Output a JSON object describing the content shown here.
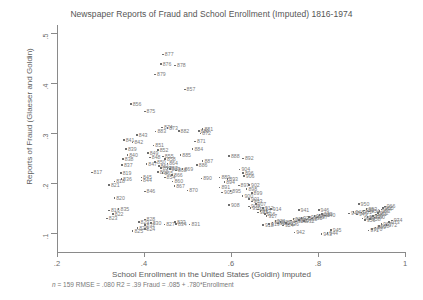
{
  "chart_data": {
    "type": "scatter",
    "title": "Newspaper Reports of Fraud and School Enrollment (Imputed) 1816-1974",
    "xlabel": "School Enrollment in the United States (Goldin) Imputed",
    "ylabel": "Reports of Fraud (Glaeser and Goldin)",
    "xlim": [
      0.16,
      1.03
    ],
    "ylim": [
      0.07,
      0.52
    ],
    "xticks": [
      ".2",
      ".4",
      ".6",
      ".8",
      "1"
    ],
    "xtickvals": [
      0.2,
      0.4,
      0.6,
      0.8,
      1.0
    ],
    "yticks": [
      ".1",
      ".2",
      ".3",
      ".4",
      ".5"
    ],
    "ytickvals": [
      0.1,
      0.2,
      0.3,
      0.4,
      0.5
    ],
    "grid": false,
    "legend": null,
    "point_labels": "year (last three digits)",
    "marker": "small square",
    "marker_color": "#6e6e6e",
    "label_color": "#7c7c7c",
    "annotation": "n = 159   RMSE =  .080 R2 =  .39  Fraud =  .085 +  .780*Enrollment",
    "annotation_parts": {
      "n": "159",
      "rmse": ".080",
      "r2": ".39",
      "intercept": ".085",
      "slope": ".780",
      "equation": "Fraud =  .085 +  .780*Enrollment"
    },
    "points": [
      {
        "label": "816",
        "x": 0.318,
        "y": 0.147
      },
      {
        "label": "817",
        "x": 0.278,
        "y": 0.223
      },
      {
        "label": "818",
        "x": 0.33,
        "y": 0.205
      },
      {
        "label": "819",
        "x": 0.345,
        "y": 0.222
      },
      {
        "label": "820",
        "x": 0.33,
        "y": 0.172
      },
      {
        "label": "821",
        "x": 0.318,
        "y": 0.198
      },
      {
        "label": "822",
        "x": 0.327,
        "y": 0.14
      },
      {
        "label": "823",
        "x": 0.313,
        "y": 0.131
      },
      {
        "label": "824",
        "x": 0.4,
        "y": 0.11
      },
      {
        "label": "825",
        "x": 0.372,
        "y": 0.106
      },
      {
        "label": "826",
        "x": 0.383,
        "y": 0.112
      },
      {
        "label": "827",
        "x": 0.445,
        "y": 0.119
      },
      {
        "label": "828",
        "x": 0.4,
        "y": 0.129
      },
      {
        "label": "829",
        "x": 0.386,
        "y": 0.124
      },
      {
        "label": "830",
        "x": 0.414,
        "y": 0.122
      },
      {
        "label": "831",
        "x": 0.503,
        "y": 0.119
      },
      {
        "label": "832",
        "x": 0.4,
        "y": 0.118
      },
      {
        "label": "833",
        "x": 0.47,
        "y": 0.124
      },
      {
        "label": "834",
        "x": 0.472,
        "y": 0.12
      },
      {
        "label": "835",
        "x": 0.34,
        "y": 0.15
      },
      {
        "label": "836",
        "x": 0.346,
        "y": 0.21
      },
      {
        "label": "837",
        "x": 0.348,
        "y": 0.238
      },
      {
        "label": "838",
        "x": 0.35,
        "y": 0.25
      },
      {
        "label": "839",
        "x": 0.357,
        "y": 0.27
      },
      {
        "label": "840",
        "x": 0.36,
        "y": 0.258
      },
      {
        "label": "841",
        "x": 0.352,
        "y": 0.288
      },
      {
        "label": "842",
        "x": 0.372,
        "y": 0.283
      },
      {
        "label": "843",
        "x": 0.382,
        "y": 0.298
      },
      {
        "label": "844",
        "x": 0.392,
        "y": 0.207
      },
      {
        "label": "845",
        "x": 0.392,
        "y": 0.213
      },
      {
        "label": "846",
        "x": 0.4,
        "y": 0.185
      },
      {
        "label": "847",
        "x": 0.404,
        "y": 0.24
      },
      {
        "label": "848",
        "x": 0.412,
        "y": 0.253
      },
      {
        "label": "849",
        "x": 0.407,
        "y": 0.262
      },
      {
        "label": "850",
        "x": 0.424,
        "y": 0.244
      },
      {
        "label": "851",
        "x": 0.42,
        "y": 0.277
      },
      {
        "label": "852",
        "x": 0.43,
        "y": 0.268
      },
      {
        "label": "853",
        "x": 0.452,
        "y": 0.231
      },
      {
        "label": "854",
        "x": 0.446,
        "y": 0.213
      },
      {
        "label": "855",
        "x": 0.442,
        "y": 0.255
      },
      {
        "label": "856",
        "x": 0.368,
        "y": 0.36
      },
      {
        "label": "857",
        "x": 0.492,
        "y": 0.389
      },
      {
        "label": "858",
        "x": 0.447,
        "y": 0.25
      },
      {
        "label": "859",
        "x": 0.437,
        "y": 0.232
      },
      {
        "label": "860",
        "x": 0.464,
        "y": 0.205
      },
      {
        "label": "861",
        "x": 0.432,
        "y": 0.236
      },
      {
        "label": "862",
        "x": 0.43,
        "y": 0.224
      },
      {
        "label": "863",
        "x": 0.458,
        "y": 0.23
      },
      {
        "label": "864",
        "x": 0.452,
        "y": 0.241
      },
      {
        "label": "865",
        "x": 0.441,
        "y": 0.222
      },
      {
        "label": "866",
        "x": 0.463,
        "y": 0.218
      },
      {
        "label": "867",
        "x": 0.468,
        "y": 0.196
      },
      {
        "label": "868",
        "x": 0.472,
        "y": 0.227
      },
      {
        "label": "869",
        "x": 0.487,
        "y": 0.23
      },
      {
        "label": "870",
        "x": 0.498,
        "y": 0.187
      },
      {
        "label": "871",
        "x": 0.516,
        "y": 0.285
      },
      {
        "label": "872",
        "x": 0.528,
        "y": 0.301
      },
      {
        "label": "873",
        "x": 0.452,
        "y": 0.312
      },
      {
        "label": "874",
        "x": 0.44,
        "y": 0.313
      },
      {
        "label": "875",
        "x": 0.4,
        "y": 0.345
      },
      {
        "label": "876",
        "x": 0.437,
        "y": 0.44
      },
      {
        "label": "877",
        "x": 0.442,
        "y": 0.459
      },
      {
        "label": "878",
        "x": 0.47,
        "y": 0.437
      },
      {
        "label": "879",
        "x": 0.424,
        "y": 0.419
      },
      {
        "label": "880",
        "x": 0.524,
        "y": 0.306
      },
      {
        "label": "881",
        "x": 0.533,
        "y": 0.31
      },
      {
        "label": "882",
        "x": 0.478,
        "y": 0.306
      },
      {
        "label": "883",
        "x": 0.425,
        "y": 0.305
      },
      {
        "label": "884",
        "x": 0.51,
        "y": 0.27
      },
      {
        "label": "885",
        "x": 0.482,
        "y": 0.258
      },
      {
        "label": "886",
        "x": 0.52,
        "y": 0.238
      },
      {
        "label": "887",
        "x": 0.533,
        "y": 0.246
      },
      {
        "label": "888",
        "x": 0.594,
        "y": 0.256
      },
      {
        "label": "889",
        "x": 0.572,
        "y": 0.213
      },
      {
        "label": "890",
        "x": 0.53,
        "y": 0.211
      },
      {
        "label": "891",
        "x": 0.572,
        "y": 0.193
      },
      {
        "label": "892",
        "x": 0.626,
        "y": 0.251
      },
      {
        "label": "893",
        "x": 0.59,
        "y": 0.21
      },
      {
        "label": "894",
        "x": 0.583,
        "y": 0.204
      },
      {
        "label": "895",
        "x": 0.597,
        "y": 0.186
      },
      {
        "label": "896",
        "x": 0.626,
        "y": 0.222
      },
      {
        "label": "897",
        "x": 0.616,
        "y": 0.197
      },
      {
        "label": "898",
        "x": 0.634,
        "y": 0.19
      },
      {
        "label": "899",
        "x": 0.646,
        "y": 0.182
      },
      {
        "label": "900",
        "x": 0.625,
        "y": 0.176
      },
      {
        "label": "901",
        "x": 0.64,
        "y": 0.17
      },
      {
        "label": "902",
        "x": 0.64,
        "y": 0.198
      },
      {
        "label": "903",
        "x": 0.646,
        "y": 0.165
      },
      {
        "label": "904",
        "x": 0.618,
        "y": 0.229
      },
      {
        "label": "905",
        "x": 0.578,
        "y": 0.183
      },
      {
        "label": "906",
        "x": 0.628,
        "y": 0.216
      },
      {
        "label": "907",
        "x": 0.655,
        "y": 0.16
      },
      {
        "label": "908",
        "x": 0.594,
        "y": 0.158
      },
      {
        "label": "909",
        "x": 0.64,
        "y": 0.155
      },
      {
        "label": "910",
        "x": 0.643,
        "y": 0.152
      },
      {
        "label": "911",
        "x": 0.66,
        "y": 0.149
      },
      {
        "label": "912",
        "x": 0.672,
        "y": 0.152
      },
      {
        "label": "913",
        "x": 0.666,
        "y": 0.146
      },
      {
        "label": "914",
        "x": 0.69,
        "y": 0.15
      },
      {
        "label": "915",
        "x": 0.66,
        "y": 0.143
      },
      {
        "label": "916",
        "x": 0.676,
        "y": 0.14
      },
      {
        "label": "917",
        "x": 0.68,
        "y": 0.136
      },
      {
        "label": "918",
        "x": 0.672,
        "y": 0.118
      },
      {
        "label": "919",
        "x": 0.686,
        "y": 0.12
      },
      {
        "label": "920",
        "x": 0.694,
        "y": 0.123
      },
      {
        "label": "921",
        "x": 0.7,
        "y": 0.126
      },
      {
        "label": "922",
        "x": 0.706,
        "y": 0.121
      },
      {
        "label": "923",
        "x": 0.712,
        "y": 0.124
      },
      {
        "label": "924",
        "x": 0.718,
        "y": 0.117
      },
      {
        "label": "925",
        "x": 0.724,
        "y": 0.122
      },
      {
        "label": "926",
        "x": 0.73,
        "y": 0.119
      },
      {
        "label": "927",
        "x": 0.736,
        "y": 0.127
      },
      {
        "label": "928",
        "x": 0.742,
        "y": 0.13
      },
      {
        "label": "929",
        "x": 0.748,
        "y": 0.125
      },
      {
        "label": "930",
        "x": 0.754,
        "y": 0.128
      },
      {
        "label": "931",
        "x": 0.76,
        "y": 0.132
      },
      {
        "label": "932",
        "x": 0.766,
        "y": 0.126
      },
      {
        "label": "933",
        "x": 0.772,
        "y": 0.129
      },
      {
        "label": "934",
        "x": 0.778,
        "y": 0.134
      },
      {
        "label": "935",
        "x": 0.784,
        "y": 0.131
      },
      {
        "label": "936",
        "x": 0.79,
        "y": 0.136
      },
      {
        "label": "937",
        "x": 0.796,
        "y": 0.133
      },
      {
        "label": "938",
        "x": 0.802,
        "y": 0.138
      },
      {
        "label": "939",
        "x": 0.808,
        "y": 0.14
      },
      {
        "label": "940",
        "x": 0.814,
        "y": 0.137
      },
      {
        "label": "941",
        "x": 0.754,
        "y": 0.148
      },
      {
        "label": "942",
        "x": 0.744,
        "y": 0.103
      },
      {
        "label": "943",
        "x": 0.806,
        "y": 0.1
      },
      {
        "label": "944",
        "x": 0.82,
        "y": 0.102
      },
      {
        "label": "945",
        "x": 0.828,
        "y": 0.108
      },
      {
        "label": "946",
        "x": 0.8,
        "y": 0.148
      },
      {
        "label": "947",
        "x": 0.87,
        "y": 0.141
      },
      {
        "label": "948",
        "x": 0.88,
        "y": 0.144
      },
      {
        "label": "949",
        "x": 0.888,
        "y": 0.139
      },
      {
        "label": "950",
        "x": 0.892,
        "y": 0.16
      },
      {
        "label": "951",
        "x": 0.898,
        "y": 0.143
      },
      {
        "label": "952",
        "x": 0.904,
        "y": 0.147
      },
      {
        "label": "953",
        "x": 0.91,
        "y": 0.15
      },
      {
        "label": "954",
        "x": 0.916,
        "y": 0.145
      },
      {
        "label": "955",
        "x": 0.9,
        "y": 0.131
      },
      {
        "label": "956",
        "x": 0.906,
        "y": 0.128
      },
      {
        "label": "957",
        "x": 0.912,
        "y": 0.134
      },
      {
        "label": "958",
        "x": 0.918,
        "y": 0.13
      },
      {
        "label": "959",
        "x": 0.924,
        "y": 0.136
      },
      {
        "label": "960",
        "x": 0.928,
        "y": 0.133
      },
      {
        "label": "961",
        "x": 0.932,
        "y": 0.139
      },
      {
        "label": "962",
        "x": 0.936,
        "y": 0.142
      },
      {
        "label": "963",
        "x": 0.94,
        "y": 0.146
      },
      {
        "label": "964",
        "x": 0.944,
        "y": 0.149
      },
      {
        "label": "965",
        "x": 0.948,
        "y": 0.152
      },
      {
        "label": "966",
        "x": 0.952,
        "y": 0.155
      },
      {
        "label": "967",
        "x": 0.944,
        "y": 0.12
      },
      {
        "label": "968",
        "x": 0.938,
        "y": 0.116
      },
      {
        "label": "969",
        "x": 0.93,
        "y": 0.113
      },
      {
        "label": "970",
        "x": 0.922,
        "y": 0.11
      },
      {
        "label": "971",
        "x": 0.914,
        "y": 0.107
      },
      {
        "label": "972",
        "x": 0.956,
        "y": 0.118
      },
      {
        "label": "973",
        "x": 0.962,
        "y": 0.124
      },
      {
        "label": "974",
        "x": 0.968,
        "y": 0.127
      }
    ]
  }
}
